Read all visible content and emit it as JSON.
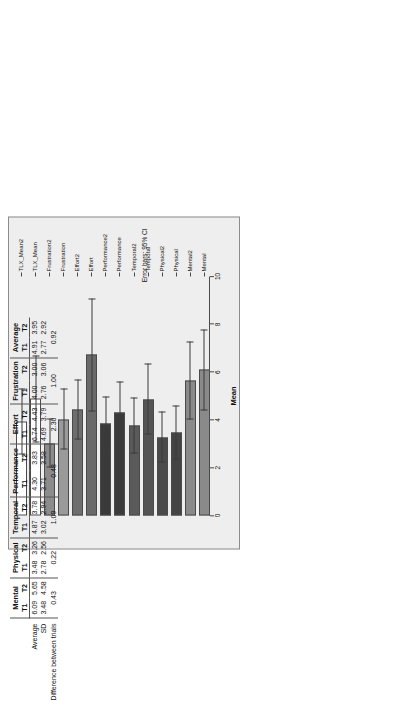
{
  "chart_data": {
    "type": "bar",
    "orientation": "horizontal",
    "title": "",
    "xlabel": "Mean",
    "ylabel": "",
    "xlim": [
      0,
      10
    ],
    "xticks": [
      0,
      2,
      4,
      6,
      8,
      10
    ],
    "axis_reversed": true,
    "grid": false,
    "annotation": "Error bars: 95% CI",
    "categories": [
      "TLX_Mean2",
      "TLX_Mean",
      "Frustration2",
      "Frustration",
      "Effort2",
      "Effort",
      "Performance2",
      "Performance",
      "Temporal2",
      "Temporal",
      "Physical2",
      "Physical",
      "Mental2",
      "Mental"
    ],
    "values": [
      3.95,
      4.91,
      3.0,
      4.0,
      4.43,
      6.74,
      3.83,
      4.3,
      3.78,
      4.87,
      3.26,
      3.48,
      5.65,
      6.09
    ],
    "ci_low": [
      2.55,
      3.05,
      2.0,
      2.75,
      3.2,
      4.35,
      2.65,
      3.0,
      2.6,
      3.4,
      2.2,
      2.35,
      4.0,
      4.4
    ],
    "ci_high": [
      5.3,
      6.7,
      4.05,
      5.3,
      5.7,
      9.1,
      5.0,
      5.6,
      4.95,
      6.35,
      4.35,
      4.6,
      7.3,
      7.8
    ],
    "bar_colors": [
      "#ffffff",
      "#ffffff",
      "#8c8c8c",
      "#9a9a9a",
      "#6e6e6e",
      "#6a6a6a",
      "#3a3a3a",
      "#3a3a3a",
      "#5a5a5a",
      "#545454",
      "#4a4a4a",
      "#444444",
      "#8a8a8a",
      "#8a8a8a"
    ]
  },
  "chart": {
    "axis_title": "Mean",
    "error_note": "Error bars: 95% CI"
  },
  "table": {
    "groups": [
      {
        "name": "Mental",
        "t1": "6.09",
        "t2": "5.65",
        "sd_t1": "3.48",
        "sd_t2": "4.58",
        "diff": "0.43"
      },
      {
        "name": "Physical",
        "t1": "3.48",
        "t2": "3.26",
        "sd_t1": "2.78",
        "sd_t2": "2.56",
        "diff": "0.22"
      },
      {
        "name": "Temporal",
        "t1": "4.87",
        "t2": "3.78",
        "sd_t1": "3.02",
        "sd_t2": "2.94",
        "diff": "1.09"
      },
      {
        "name": "Performance",
        "t1": "4.30",
        "t2": "3.83",
        "sd_t1": "3.71",
        "sd_t2": "3.58",
        "diff": "0.48"
      },
      {
        "name": "Effort",
        "t1": "6.74",
        "t2": "4.43",
        "sd_t1": "4.69",
        "sd_t2": "3.79",
        "diff": "2.30"
      },
      {
        "name": "Frustration",
        "t1": "4.00",
        "t2": "3.00",
        "sd_t1": "2.76",
        "sd_t2": "3.06",
        "diff": "1.00"
      },
      {
        "name": "Average",
        "t1": "4.91",
        "t2": "3.95",
        "sd_t1": "2.77",
        "sd_t2": "2.92",
        "diff": "0.92"
      }
    ],
    "col_t1": "T1",
    "col_t2": "T2",
    "rows": {
      "average": "Average",
      "sd": "SD",
      "difference": "Difference between trials"
    }
  }
}
